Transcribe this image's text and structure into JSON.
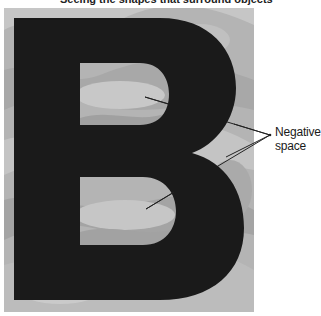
{
  "title": "Seeing the shapes that surround objects",
  "figure": {
    "letter": "B",
    "letter_color": "#1a1a1a",
    "background_color": "#b4b4b4",
    "pattern_colors": [
      "#c8c8c8",
      "#a6a6a6",
      "#bebebe",
      "#9c9c9c"
    ]
  },
  "callout": {
    "label_line1": "Negative",
    "label_line2": "space",
    "pointer_color": "#222222"
  }
}
